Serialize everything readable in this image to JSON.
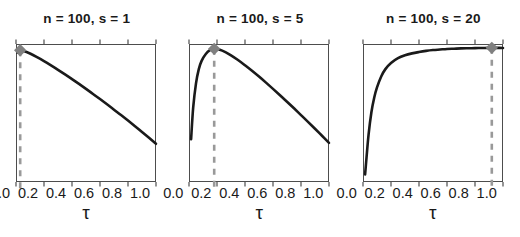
{
  "figure": {
    "width": 520,
    "height": 237,
    "background": "#ffffff",
    "panel_count": 3
  },
  "style": {
    "curve_color": "#1a1a1a",
    "marker_color": "#808080",
    "dashed_line_color": "#999999",
    "axis_color": "#4d4d4d",
    "text_color": "#1a1a1a"
  },
  "chart_data": [
    {
      "type": "line",
      "title": "n = 100, s = 1",
      "xlabel": "τ",
      "ylabel": "",
      "xlim": [
        0.0,
        1.0
      ],
      "ylim": [
        0.0,
        1.0
      ],
      "xticks": [
        0.0,
        0.2,
        0.4,
        0.6,
        0.8,
        1.0
      ],
      "xticklabels": [
        "0.0",
        "0.2",
        "0.4",
        "0.6",
        "0.8",
        "1.0"
      ],
      "yticks": [],
      "yticklabels": [],
      "grid": false,
      "legend": null,
      "n": 100,
      "s": 1,
      "optimum_tau": 0.03,
      "marker": {
        "shape": "diamond",
        "x": 0.03,
        "y": 0.955
      },
      "vline": {
        "x": 0.03,
        "style": "dashed"
      },
      "x": [
        0.01,
        0.03,
        0.05,
        0.1,
        0.15,
        0.2,
        0.25,
        0.3,
        0.35,
        0.4,
        0.45,
        0.5,
        0.55,
        0.6,
        0.65,
        0.7,
        0.75,
        0.8,
        0.85,
        0.9,
        0.95,
        1.0
      ],
      "y": [
        0.938,
        0.955,
        0.951,
        0.931,
        0.905,
        0.876,
        0.845,
        0.813,
        0.78,
        0.746,
        0.711,
        0.675,
        0.638,
        0.601,
        0.563,
        0.524,
        0.485,
        0.445,
        0.404,
        0.362,
        0.32,
        0.277
      ]
    },
    {
      "type": "line",
      "title": "n = 100, s = 5",
      "xlabel": "τ",
      "ylabel": "",
      "xlim": [
        0.0,
        1.0
      ],
      "ylim": [
        0.0,
        1.0
      ],
      "xticks": [
        0.0,
        0.2,
        0.4,
        0.6,
        0.8,
        1.0
      ],
      "xticklabels": [
        "0.0",
        "0.2",
        "0.4",
        "0.6",
        "0.8",
        "1.0"
      ],
      "yticks": [],
      "yticklabels": [],
      "grid": false,
      "legend": null,
      "n": 100,
      "s": 5,
      "optimum_tau": 0.18,
      "marker": {
        "shape": "diamond",
        "x": 0.18,
        "y": 0.965
      },
      "vline": {
        "x": 0.18,
        "style": "dashed"
      },
      "x": [
        0.015,
        0.03,
        0.05,
        0.07,
        0.09,
        0.12,
        0.15,
        0.18,
        0.22,
        0.26,
        0.3,
        0.35,
        0.4,
        0.45,
        0.5,
        0.55,
        0.6,
        0.65,
        0.7,
        0.75,
        0.8,
        0.85,
        0.9,
        0.95,
        1.0
      ],
      "y": [
        0.31,
        0.54,
        0.715,
        0.818,
        0.878,
        0.928,
        0.955,
        0.965,
        0.958,
        0.941,
        0.918,
        0.884,
        0.846,
        0.806,
        0.764,
        0.72,
        0.675,
        0.629,
        0.582,
        0.534,
        0.485,
        0.436,
        0.386,
        0.335,
        0.284
      ]
    },
    {
      "type": "line",
      "title": "n = 100, s = 20",
      "xlabel": "τ",
      "ylabel": "",
      "xlim": [
        0.0,
        1.0
      ],
      "ylim": [
        0.0,
        1.0
      ],
      "xticks": [
        0.0,
        0.2,
        0.4,
        0.6,
        0.8,
        1.0
      ],
      "xticklabels": [
        "0.0",
        "0.2",
        "0.4",
        "0.6",
        "0.8",
        "1.0"
      ],
      "yticks": [],
      "yticklabels": [],
      "grid": false,
      "legend": null,
      "n": 100,
      "s": 20,
      "optimum_tau": 0.92,
      "marker": {
        "shape": "diamond",
        "x": 0.92,
        "y": 0.972
      },
      "vline": {
        "x": 0.92,
        "style": "dashed"
      },
      "x": [
        0.015,
        0.025,
        0.04,
        0.06,
        0.08,
        0.1,
        0.13,
        0.16,
        0.2,
        0.25,
        0.3,
        0.35,
        0.4,
        0.45,
        0.5,
        0.55,
        0.6,
        0.65,
        0.7,
        0.75,
        0.8,
        0.85,
        0.9,
        0.92,
        0.96,
        1.0
      ],
      "y": [
        0.055,
        0.175,
        0.345,
        0.505,
        0.61,
        0.685,
        0.765,
        0.818,
        0.862,
        0.897,
        0.918,
        0.932,
        0.942,
        0.95,
        0.956,
        0.96,
        0.964,
        0.966,
        0.968,
        0.969,
        0.97,
        0.971,
        0.972,
        0.972,
        0.972,
        0.971
      ]
    }
  ]
}
